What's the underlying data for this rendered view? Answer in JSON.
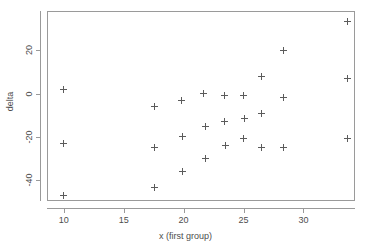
{
  "chart_data": {
    "type": "scatter",
    "title": "",
    "xlabel": "x (first group)",
    "ylabel": "delta",
    "xlim": [
      8.6,
      34.3
    ],
    "ylim": [
      -49.5,
      38.0
    ],
    "grid": false,
    "legend": "none",
    "marker": "plus-cross",
    "marker_color": "#5b5b5b",
    "xticks": [
      10,
      15,
      20,
      25,
      30
    ],
    "xtick_labels": [
      "10",
      "15",
      "20",
      "25",
      "30"
    ],
    "yticks": [
      20,
      0,
      -20,
      -40
    ],
    "ytick_labels": [
      "20",
      "0",
      "-20",
      "-40"
    ],
    "points": [
      {
        "x": 10.0,
        "y": 2.0
      },
      {
        "x": 10.0,
        "y": -23.0
      },
      {
        "x": 10.0,
        "y": -47.0
      },
      {
        "x": 17.6,
        "y": -6.0
      },
      {
        "x": 17.6,
        "y": -25.0
      },
      {
        "x": 17.6,
        "y": -43.5
      },
      {
        "x": 19.8,
        "y": -3.0
      },
      {
        "x": 19.9,
        "y": -20.0
      },
      {
        "x": 19.9,
        "y": -36.0
      },
      {
        "x": 21.7,
        "y": 0.0
      },
      {
        "x": 21.8,
        "y": -15.0
      },
      {
        "x": 21.8,
        "y": -30.0
      },
      {
        "x": 23.4,
        "y": -1.0
      },
      {
        "x": 23.4,
        "y": -13.0
      },
      {
        "x": 23.5,
        "y": -24.0
      },
      {
        "x": 25.0,
        "y": -1.0
      },
      {
        "x": 25.1,
        "y": -11.5
      },
      {
        "x": 25.0,
        "y": -20.5
      },
      {
        "x": 26.5,
        "y": 8.0
      },
      {
        "x": 26.5,
        "y": -9.0
      },
      {
        "x": 26.5,
        "y": -25.0
      },
      {
        "x": 28.3,
        "y": 20.0
      },
      {
        "x": 28.3,
        "y": -2.0
      },
      {
        "x": 28.3,
        "y": -25.0
      },
      {
        "x": 33.7,
        "y": 33.0
      },
      {
        "x": 33.7,
        "y": 7.0
      },
      {
        "x": 33.7,
        "y": -20.5
      }
    ]
  },
  "axes": {
    "x_title": "x (first group)",
    "y_title": "delta"
  }
}
